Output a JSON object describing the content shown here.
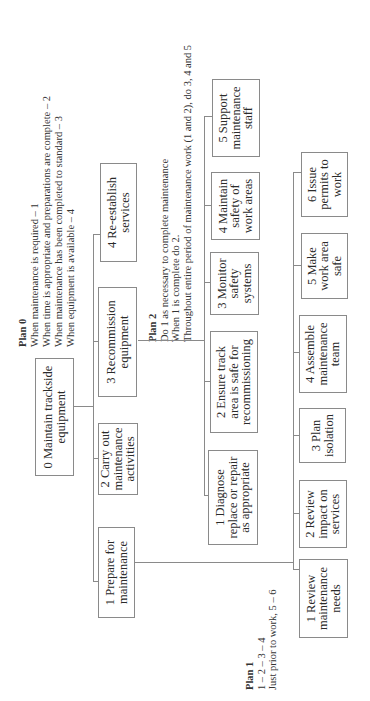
{
  "diagram": {
    "type": "hierarchical-task-analysis",
    "orientation": "rotated-90-ccw",
    "root": {
      "id": "0",
      "label": "0 Maintain trackside\nequipment"
    },
    "level1": [
      {
        "id": "1",
        "label": "1 Prepare for\nmaintenance"
      },
      {
        "id": "2",
        "label": "2 Carry out\nmaintenance\nactivities"
      },
      {
        "id": "3",
        "label": "3 Recommission\nequipment"
      },
      {
        "id": "4",
        "label": "4 Re-establish\nservices"
      }
    ],
    "prepare_subtasks": [
      {
        "id": "1.1",
        "label": "1 Review\nmaintenance\nneeds"
      },
      {
        "id": "1.2",
        "label": "2 Review\nimpact on\nservices"
      },
      {
        "id": "1.3",
        "label": "3 Plan\nisolation"
      },
      {
        "id": "1.4",
        "label": "4 Assemble\nmaintenance\nteam"
      },
      {
        "id": "1.5",
        "label": "5 Make\nwork area\nsafe"
      },
      {
        "id": "1.6",
        "label": "6 Issue\npermits to\nwork"
      }
    ],
    "carry_out_subtasks": [
      {
        "id": "2.1",
        "label": "1 Diagnose\nreplace or repair\nas appropriate"
      },
      {
        "id": "2.2",
        "label": "2 Ensure track\narea is safe for\nrecommissioning"
      },
      {
        "id": "2.3",
        "label": "3 Monitor\nsafety\nsystems"
      },
      {
        "id": "2.4",
        "label": "4 Maintain\nsafety of\nwork areas"
      },
      {
        "id": "2.5",
        "label": "5 Support\nmaintenance\nstaff"
      }
    ],
    "plans": {
      "plan0": {
        "title": "Plan 0",
        "lines": [
          "When maintenance is required – 1",
          "When time is appropriate and preparations are complete – 2",
          "When maintenance has been completed to standard – 3",
          "When equipment is available – 4"
        ]
      },
      "plan1": {
        "title": "Plan 1",
        "lines": [
          "1 – 2 – 3 – 4",
          "Just prior to work, 5 – 6"
        ]
      },
      "plan2": {
        "title": "Plan 2",
        "lines": [
          "Do 1 as necessary to complete maintenance",
          "When 1 is complete do 2.",
          "Throughout entire period of maintenance work (1 and 2), do 3, 4 and 5"
        ]
      }
    },
    "colors": {
      "line": "#8a8a8a",
      "text": "#2a2a2a",
      "background": "#ffffff"
    }
  }
}
